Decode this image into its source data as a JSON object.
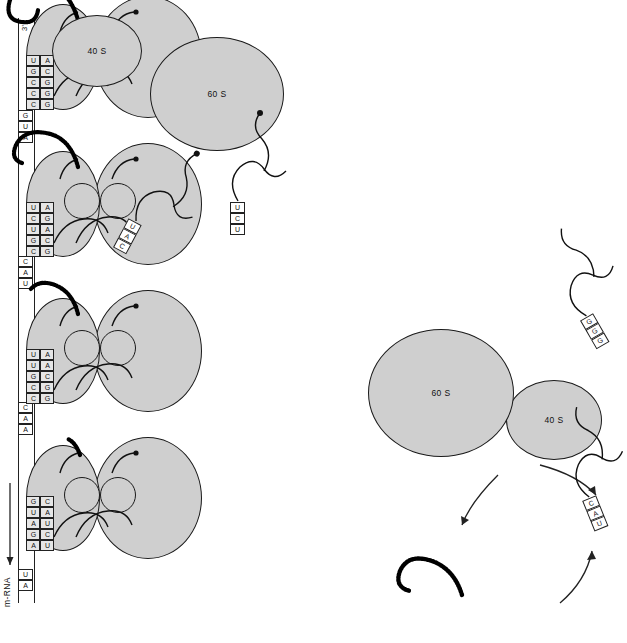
{
  "diagram": {
    "mrna_label": "m-RNA",
    "five_prime": "5'",
    "three_prime": "3'",
    "direction_arrow": "arrow-up",
    "colors": {
      "subunit_fill": "#cfcfcf",
      "outline": "#1a1a1a",
      "base_fill": "#e6e6e6",
      "chain": "#000000"
    }
  },
  "subunit_labels": {
    "small": "40 S",
    "large": "60 S"
  },
  "mrna_sequence": {
    "five_end_bases": [
      "A",
      "U"
    ],
    "spacer_1": [
      "A",
      "A",
      "C"
    ],
    "spacer_2": [
      "U",
      "A",
      "C"
    ],
    "spacer_3": [
      "A",
      "U",
      "G"
    ],
    "three_end_label": "3'"
  },
  "ribosomes": [
    {
      "id": "ribosome-1",
      "codon": [
        "A",
        "G",
        "A",
        "U",
        "G"
      ],
      "anticodon": [
        "U",
        "C",
        "U",
        "A",
        "C"
      ],
      "peptide_length": "short",
      "small_label": "40 S",
      "large_label": "60 S"
    },
    {
      "id": "ribosome-2",
      "codon": [
        "C",
        "C",
        "G",
        "U",
        "U"
      ],
      "anticodon": [
        "G",
        "G",
        "C",
        "A",
        "A"
      ],
      "peptide_length": "medium",
      "small_label": "40 S",
      "large_label": "60 S"
    },
    {
      "id": "ribosome-3",
      "codon": [
        "C",
        "G",
        "U",
        "C",
        "U"
      ],
      "anticodon": [
        "G",
        "C",
        "A",
        "G",
        "A"
      ],
      "peptide_length": "long",
      "small_label": "40 S",
      "large_label": "60 S"
    },
    {
      "id": "ribosome-4",
      "codon": [
        "C",
        "C",
        "C",
        "G",
        "U"
      ],
      "anticodon": [
        "G",
        "G",
        "G",
        "C",
        "A"
      ],
      "peptide_length": "longest",
      "small_label": "40 S",
      "large_label": "60 S"
    }
  ],
  "free_subunits_top": {
    "small_label": "40 S",
    "large_label": "60 S"
  },
  "free_subunits_bottom": {
    "small_label": "40 S",
    "large_label": "60 S"
  },
  "free_trnas": [
    {
      "id": "trna-cau",
      "anticodon": [
        "C",
        "A",
        "U"
      ],
      "charged": true
    },
    {
      "id": "trna-ucu",
      "anticodon": [
        "U",
        "C",
        "U"
      ],
      "charged": true
    },
    {
      "id": "trna-uac",
      "anticodon": [
        "U",
        "A",
        "C"
      ],
      "charged": false
    },
    {
      "id": "trna-ggg",
      "anticodon": [
        "G",
        "G",
        "G"
      ],
      "charged": false
    }
  ],
  "released_polypeptide": {
    "label": "",
    "shown": true
  }
}
